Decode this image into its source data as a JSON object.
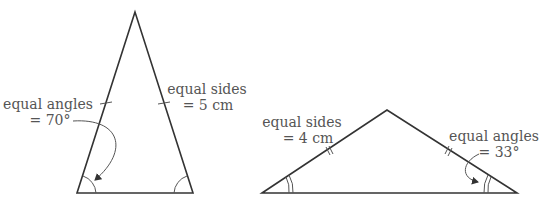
{
  "figure": {
    "left_triangle": {
      "type": "isosceles",
      "equal_angles_label": "equal angles",
      "equal_angles_value": "= 70°",
      "equal_sides_label": "equal sides",
      "equal_sides_value": "= 5 cm"
    },
    "right_triangle": {
      "type": "isosceles",
      "equal_sides_label": "equal sides",
      "equal_sides_value": "= 4 cm",
      "equal_angles_label": "equal angles",
      "equal_angles_value": "= 33°"
    },
    "colors": {
      "line": "#333333",
      "text": "#555555"
    }
  }
}
